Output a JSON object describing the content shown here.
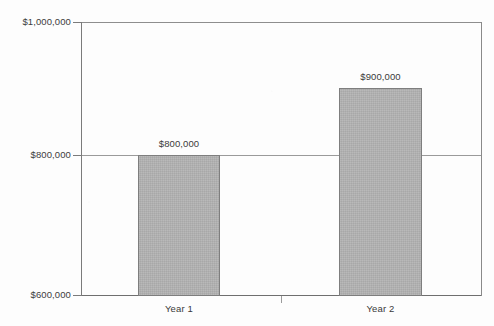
{
  "chart_data": {
    "type": "bar",
    "title": "",
    "subtitle": "",
    "xlabel": "",
    "ylabel": "",
    "categories": [
      "Year 1",
      "Year 2"
    ],
    "values": [
      800000,
      900000
    ],
    "data_labels": [
      "$800,000",
      "$900,000"
    ],
    "ylim": [
      600000,
      1000000
    ],
    "ytick_values": [
      1000000,
      800000,
      600000
    ],
    "ytick_labels": [
      "$1,000,000",
      "$800,000",
      "$600,000"
    ],
    "grid": true,
    "grid_axis": "y",
    "legend": false,
    "legend_position": "none",
    "series": [
      {
        "name": "",
        "values": [
          800000,
          900000
        ]
      }
    ],
    "colors": {
      "bar_fill": "#b2b2b2",
      "bar_border": "#7e7e7e",
      "axis": "#7b7b7b",
      "gridline": "#9a9a9a",
      "text": "#3a3a3a",
      "background": "#fdfdfd"
    }
  },
  "axes": {
    "y": {
      "ticks": [
        {
          "label": "$1,000,000",
          "value": 1000000
        },
        {
          "label": "$800,000",
          "value": 800000
        },
        {
          "label": "$600,000",
          "value": 600000
        }
      ]
    },
    "x": {
      "ticks": [
        {
          "label": "Year 1"
        },
        {
          "label": "Year 2"
        }
      ]
    }
  },
  "bars": [
    {
      "category": "Year 1",
      "label": "$800,000",
      "value": 800000
    },
    {
      "category": "Year 2",
      "label": "$900,000",
      "value": 900000
    }
  ]
}
